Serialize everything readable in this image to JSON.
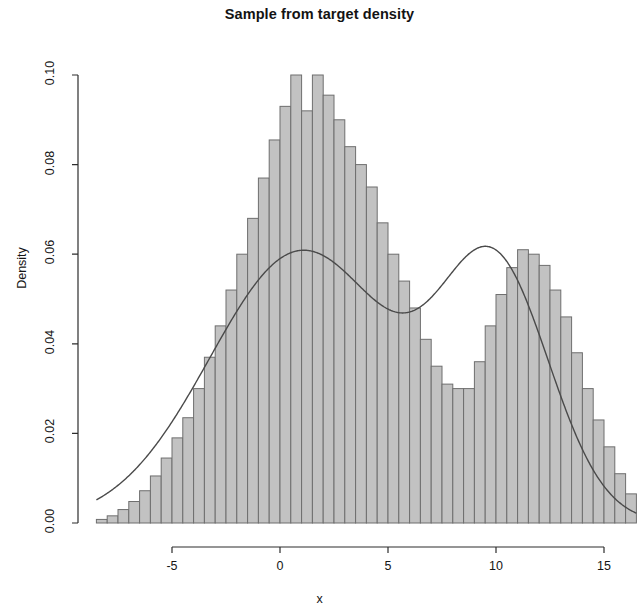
{
  "figure": {
    "title": "Sample from target density",
    "xlabel": "x",
    "ylabel": "Density"
  },
  "axes": {
    "y_ticks": [
      "0.00",
      "0.02",
      "0.04",
      "0.06",
      "0.08",
      "0.10"
    ],
    "x_ticks": [
      "-5",
      "0",
      "5",
      "10",
      "15"
    ]
  },
  "chart_data": {
    "type": "bar",
    "title": "Sample from target density",
    "xlabel": "x",
    "ylabel": "Density",
    "xlim": [
      -8.5,
      16.5
    ],
    "ylim": [
      0.0,
      0.1
    ],
    "xticks": [
      -5,
      0,
      5,
      10,
      15
    ],
    "yticks": [
      0.0,
      0.02,
      0.04,
      0.06,
      0.08,
      0.1
    ],
    "grid": false,
    "legend": null,
    "bin_width": 0.5,
    "bin_left_edges": [
      -8.5,
      -8.0,
      -7.5,
      -7.0,
      -6.5,
      -6.0,
      -5.5,
      -5.0,
      -4.5,
      -4.0,
      -3.5,
      -3.0,
      -2.5,
      -2.0,
      -1.5,
      -1.0,
      -0.5,
      0.0,
      0.5,
      1.0,
      1.5,
      2.0,
      2.5,
      3.0,
      3.5,
      4.0,
      4.5,
      5.0,
      5.5,
      6.0,
      6.5,
      7.0,
      7.5,
      8.0,
      8.5,
      9.0,
      9.5,
      10.0,
      10.5,
      11.0,
      11.5,
      12.0,
      12.5,
      13.0,
      13.5,
      14.0,
      14.5,
      15.0,
      15.5,
      16.0
    ],
    "values": [
      0.0008,
      0.0016,
      0.003,
      0.0048,
      0.0072,
      0.0105,
      0.0145,
      0.019,
      0.0235,
      0.03,
      0.037,
      0.044,
      0.052,
      0.06,
      0.068,
      0.077,
      0.0855,
      0.093,
      0.1,
      0.092,
      0.1,
      0.0955,
      0.09,
      0.084,
      0.08,
      0.075,
      0.067,
      0.06,
      0.054,
      0.048,
      0.041,
      0.035,
      0.031,
      0.03,
      0.03,
      0.036,
      0.044,
      0.051,
      0.057,
      0.061,
      0.06,
      0.0575,
      0.052,
      0.046,
      0.038,
      0.03,
      0.023,
      0.017,
      0.011,
      0.0065
    ],
    "overlay_curve": {
      "name": "target density",
      "type": "line",
      "mixture": [
        {
          "weight": 0.655,
          "mean": 1.05,
          "sd": 4.3
        },
        {
          "weight": 0.345,
          "mean": 10.0,
          "sd": 2.55
        }
      ],
      "peak1": {
        "x": 1.05,
        "y": 0.0931
      },
      "peak2": {
        "x": 10.0,
        "y": 0.0612
      },
      "trough": {
        "x": 7.05,
        "y": 0.0288
      }
    }
  },
  "colors": {
    "bar_fill": "#c2c2c2",
    "bar_border": "#6e6e6e",
    "curve": "#4a4a4a",
    "axis": "#2d2d2d",
    "text": "#151515",
    "background": "#ffffff"
  }
}
